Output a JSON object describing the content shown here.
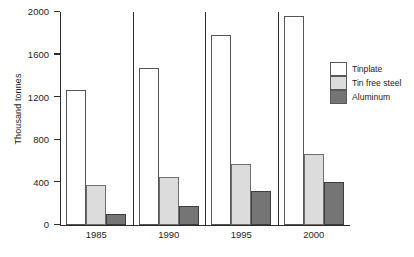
{
  "chart_data": {
    "type": "bar",
    "title": "",
    "xlabel": "",
    "ylabel": "Thousand tonnes",
    "categories": [
      "1985",
      "1990",
      "1995",
      "2000"
    ],
    "series": [
      {
        "name": "Tinplate",
        "color": "#ffffff",
        "values": [
          1270,
          1470,
          1780,
          1960
        ]
      },
      {
        "name": "Tin free steel",
        "color": "#dcdcdc",
        "values": [
          380,
          450,
          575,
          665
        ]
      },
      {
        "name": "Aluminum",
        "color": "#757575",
        "values": [
          100,
          175,
          315,
          405
        ]
      }
    ],
    "ylim": [
      0,
      2000
    ],
    "yticks": [
      0,
      400,
      800,
      1200,
      1600,
      2000
    ],
    "ytick_labels": [
      "0",
      "400",
      "800",
      "1200",
      "1600",
      "2000"
    ],
    "grid": false,
    "legend_position": "right"
  },
  "axis": {
    "y_title": "Thousand tonnes"
  }
}
